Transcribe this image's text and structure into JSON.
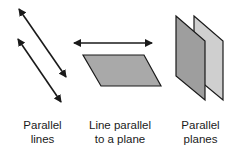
{
  "figures": [
    {
      "id": "parallel-lines",
      "label_line1": "Parallel",
      "label_line2": "lines"
    },
    {
      "id": "line-parallel-plane",
      "label_line1": "Line parallel",
      "label_line2": "to a plane"
    },
    {
      "id": "parallel-planes",
      "label_line1": "Parallel",
      "label_line2": "planes"
    }
  ],
  "colors": {
    "stroke": "#1a1a1a",
    "plane_fill": "#a9a9a9",
    "front_plane_fill": "#9e9e9e",
    "back_plane_fill": "#cfcfcf"
  }
}
